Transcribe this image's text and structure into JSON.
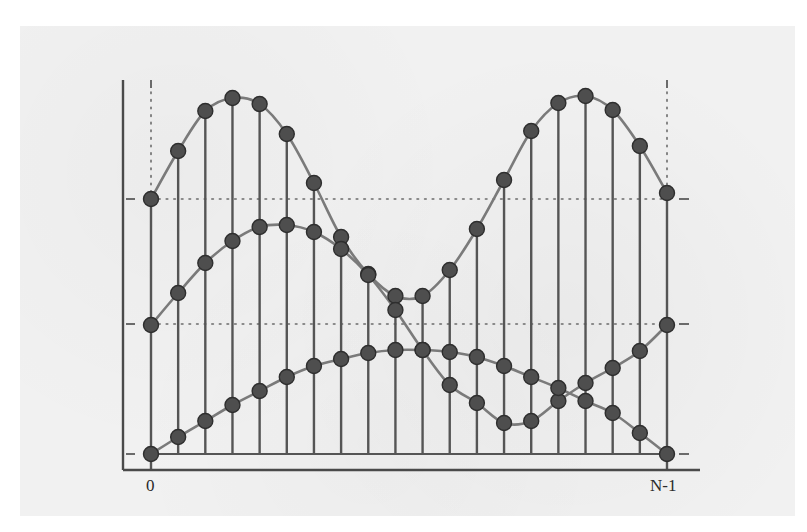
{
  "figure": {
    "x_label_start": "0",
    "x_label_end": "N-1",
    "colors": {
      "background": "#f1f1f1",
      "axis": "#4a4a4a",
      "stem": "#555555",
      "curve": "#7a7a7a",
      "marker_fill": "#4e4e4e",
      "marker_stroke": "#2e2e2e",
      "dotted": "#6a6a6a"
    },
    "geometry": {
      "x_start": 151,
      "x_end": 667,
      "baseline_y": 454,
      "axis_x": 123,
      "axis_y": 470,
      "axis_top": 80,
      "axis_right": 700,
      "ref_top_y": 199,
      "ref_mid_y": 324,
      "guide_top": 80,
      "marker_r": 7.5
    },
    "series": [
      {
        "name": "upper-double-hump",
        "y_pixels": [
          199,
          151,
          111,
          98,
          104,
          134,
          183,
          237,
          274,
          296,
          296,
          270,
          229,
          180,
          131,
          103,
          96,
          110,
          146,
          193
        ]
      },
      {
        "name": "middle-periodic",
        "y_pixels": [
          325,
          293,
          263,
          241,
          227,
          225,
          232,
          249,
          275,
          310,
          350,
          385,
          403,
          423,
          421,
          401,
          383,
          368,
          351,
          325
        ]
      },
      {
        "name": "lower-arch",
        "y_pixels": [
          454,
          437,
          421,
          405,
          391,
          377,
          366,
          359,
          353,
          350,
          350,
          352,
          357,
          366,
          377,
          388,
          401,
          413,
          433,
          454
        ]
      }
    ]
  },
  "chart_data": {
    "type": "line",
    "title": "",
    "xlabel": "sample index n (0 … N-1)",
    "ylabel": "",
    "x_tick_labels": [
      "0",
      "N-1"
    ],
    "x": [
      0,
      1,
      2,
      3,
      4,
      5,
      6,
      7,
      8,
      9,
      10,
      11,
      12,
      13,
      14,
      15,
      16,
      17,
      18,
      19
    ],
    "stems": true,
    "markers": "filled circles",
    "grid": false,
    "series": [
      {
        "name": "upper sequence (double hump, periodic ends)",
        "values": [
          0.99,
          1.37,
          1.68,
          1.78,
          1.73,
          1.5,
          1.11,
          0.69,
          0.4,
          0.23,
          0.23,
          0.43,
          0.75,
          1.13,
          1.51,
          1.73,
          1.78,
          1.67,
          1.39,
          1.02
        ]
      },
      {
        "name": "middle sequence (smooth periodic)",
        "values": [
          1.01,
          1.26,
          1.49,
          1.66,
          1.77,
          1.79,
          1.73,
          1.6,
          1.4,
          1.13,
          0.81,
          0.54,
          0.4,
          0.24,
          0.26,
          0.41,
          0.55,
          0.67,
          0.8,
          1.01
        ]
      },
      {
        "name": "lower sequence (arch, zero ends)",
        "values": [
          0.0,
          0.13,
          0.26,
          0.38,
          0.49,
          0.6,
          0.69,
          0.74,
          0.79,
          0.81,
          0.81,
          0.8,
          0.76,
          0.69,
          0.6,
          0.52,
          0.41,
          0.32,
          0.16,
          0.0
        ]
      }
    ],
    "reference_lines": [
      {
        "style": "dotted",
        "meaning": "upper sequence endpoint level",
        "value": 0.99
      },
      {
        "style": "dotted",
        "meaning": "middle sequence endpoint level",
        "value": 1.01
      }
    ],
    "ylim": [
      0,
      2.0
    ]
  }
}
